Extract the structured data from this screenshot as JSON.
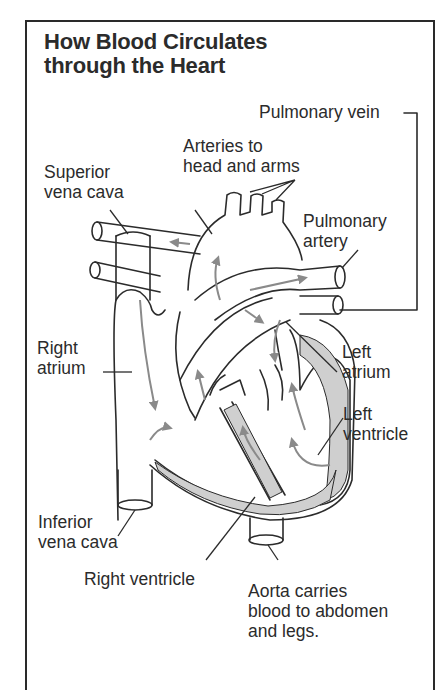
{
  "title": {
    "line1": "How Blood Circulates",
    "line2": "through the Heart"
  },
  "labels": {
    "pulmonary_vein": "Pulmonary vein",
    "arteries_head_arms": [
      "Arteries to",
      "head and arms"
    ],
    "superior_vena_cava": [
      "Superior",
      "vena cava"
    ],
    "pulmonary_artery": [
      "Pulmonary",
      "artery"
    ],
    "right_atrium": [
      "Right",
      "atrium"
    ],
    "left_atrium": [
      "Left",
      "atrium"
    ],
    "left_ventricle": [
      "Left",
      "ventricle"
    ],
    "inferior_vena_cava": [
      "Inferior",
      "vena cava"
    ],
    "right_ventricle": "Right ventricle",
    "aorta": [
      "Aorta carries",
      "blood to abdomen",
      "and legs."
    ]
  },
  "colors": {
    "ink": "#2b2b2b",
    "flow_arrow": "#8a8a8a",
    "muscle": "#bdbdbd",
    "background": "#ffffff"
  }
}
